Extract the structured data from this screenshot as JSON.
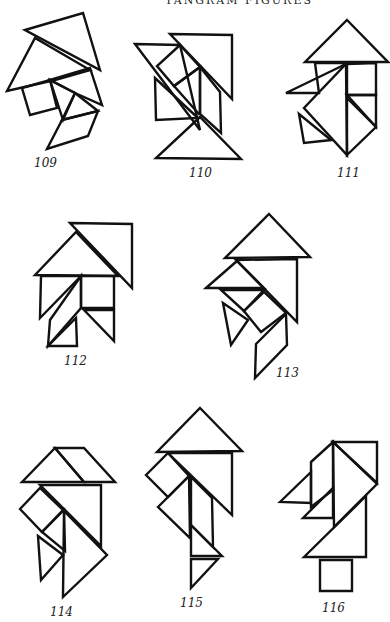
{
  "page": {
    "header": "TANGRAM FIGURES",
    "figures": [
      {
        "id": "109",
        "label": "109"
      },
      {
        "id": "110",
        "label": "110"
      },
      {
        "id": "111",
        "label": "111"
      },
      {
        "id": "112",
        "label": "112"
      },
      {
        "id": "113",
        "label": "113"
      },
      {
        "id": "114",
        "label": "114"
      },
      {
        "id": "115",
        "label": "115"
      },
      {
        "id": "116",
        "label": "116"
      }
    ]
  },
  "colors": {
    "ink": "#111111",
    "paper": "#ffffff"
  }
}
